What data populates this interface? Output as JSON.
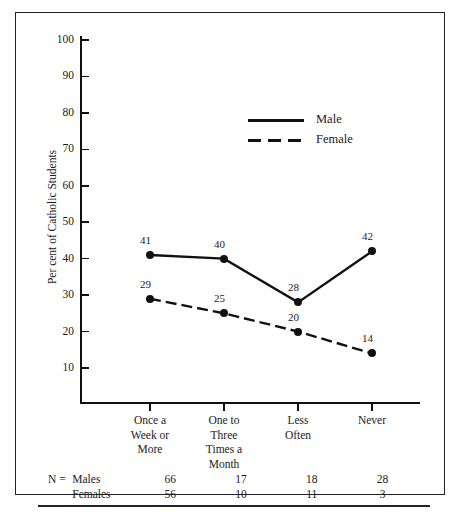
{
  "chart_data": {
    "type": "line",
    "title": "",
    "xlabel": "",
    "ylabel": "Per cent of Catholic Students",
    "ylim": [
      0,
      100
    ],
    "yticks": [
      100,
      90,
      80,
      70,
      60,
      50,
      40,
      30,
      20,
      10
    ],
    "grid": false,
    "legend_position": "upper-center",
    "categories": [
      "Once a\nWeek or\nMore",
      "One to\nThree\nTimes a\nMonth",
      "Less\nOften",
      "Never"
    ],
    "series": [
      {
        "name": "Male",
        "style": "solid",
        "values": [
          41,
          40,
          28,
          42
        ]
      },
      {
        "name": "Female",
        "style": "dashed",
        "values": [
          29,
          25,
          20,
          14
        ]
      }
    ]
  },
  "ylabel": "Per cent of Catholic Students",
  "yticks": [
    {
      "label": "100"
    },
    {
      "label": "90"
    },
    {
      "label": "80"
    },
    {
      "label": "70"
    },
    {
      "label": "60"
    },
    {
      "label": "50"
    },
    {
      "label": "40"
    },
    {
      "label": "30"
    },
    {
      "label": "20"
    },
    {
      "label": "10"
    }
  ],
  "categories": [
    {
      "lines": [
        "Once a",
        "Week or",
        "More"
      ]
    },
    {
      "lines": [
        "One to",
        "Three",
        "Times a",
        "Month"
      ]
    },
    {
      "lines": [
        "Less",
        "Often"
      ]
    },
    {
      "lines": [
        "Never"
      ]
    }
  ],
  "legend": [
    {
      "label": "Male",
      "style": "solid"
    },
    {
      "label": "Female",
      "style": "dashed"
    }
  ],
  "point_labels": {
    "male": [
      "41",
      "40",
      "28",
      "42"
    ],
    "female": [
      "29",
      "25",
      "20",
      "14"
    ]
  },
  "ntable": {
    "n_symbol": "N =",
    "rows": [
      {
        "label": "Males",
        "values": [
          "66",
          "17",
          "18",
          "28"
        ]
      },
      {
        "label": "Females",
        "values": [
          "56",
          "10",
          "11",
          "3"
        ]
      }
    ]
  },
  "colors": {
    "ink": "#111111",
    "border": "#222222",
    "background": "#ffffff"
  }
}
